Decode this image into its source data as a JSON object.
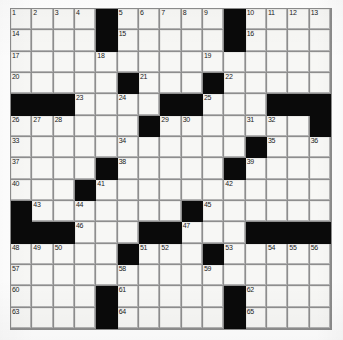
{
  "puzzle": {
    "type": "crossword-grid",
    "rows": 15,
    "columns": 15,
    "block_color": "#0a0a0a",
    "cell_color": "#f7f7f5",
    "grid_line_color": "#8e8e8e",
    "background_color": "#ffffff",
    "cells": [
      [
        {
          "n": "1"
        },
        {
          "n": "2"
        },
        {
          "n": "3"
        },
        {
          "n": "4"
        },
        {
          "b": true
        },
        {
          "n": "5"
        },
        {
          "n": "6"
        },
        {
          "n": "7"
        },
        {
          "n": "8"
        },
        {
          "n": "9"
        },
        {
          "b": true
        },
        {
          "n": "10"
        },
        {
          "n": "11"
        },
        {
          "n": "12"
        },
        {
          "n": "13"
        }
      ],
      [
        {
          "n": "14"
        },
        {},
        {},
        {},
        {
          "b": true
        },
        {
          "n": "15"
        },
        {},
        {},
        {},
        {},
        {
          "b": true
        },
        {
          "n": "16"
        },
        {},
        {},
        {}
      ],
      [
        {
          "n": "17"
        },
        {},
        {},
        {},
        {
          "n": "18"
        },
        {},
        {},
        {},
        {},
        {
          "n": "19"
        },
        {},
        {},
        {},
        {},
        {}
      ],
      [
        {
          "n": "20"
        },
        {},
        {},
        {},
        {},
        {
          "b": true
        },
        {
          "n": "21"
        },
        {},
        {},
        {
          "b": true
        },
        {
          "n": "22"
        },
        {},
        {},
        {},
        {}
      ],
      [
        {
          "b": true
        },
        {
          "b": true
        },
        {
          "b": true
        },
        {
          "n": "23"
        },
        {},
        {
          "n": "24"
        },
        {},
        {
          "b": true
        },
        {
          "b": true
        },
        {
          "n": "25"
        },
        {},
        {},
        {
          "b": true
        },
        {
          "b": true
        },
        {
          "b": true
        }
      ],
      [
        {
          "n": "26"
        },
        {
          "n": "27"
        },
        {
          "n": "28"
        },
        {},
        {},
        {},
        {
          "b": true
        },
        {
          "n": "29"
        },
        {
          "n": "30"
        },
        {},
        {},
        {
          "n": "31"
        },
        {
          "n": "32"
        },
        {},
        {
          "b": true
        }
      ],
      [
        {
          "n": "33"
        },
        {},
        {},
        {},
        {},
        {
          "n": "34"
        },
        {},
        {},
        {},
        {},
        {},
        {
          "b": true
        },
        {
          "n": "35"
        },
        {},
        {
          "n": "36"
        }
      ],
      [
        {
          "n": "37"
        },
        {},
        {},
        {},
        {
          "b": true
        },
        {
          "n": "38"
        },
        {},
        {},
        {},
        {},
        {
          "b": true
        },
        {
          "n": "39"
        },
        {},
        {},
        {}
      ],
      [
        {
          "n": "40"
        },
        {},
        {},
        {
          "b": true
        },
        {
          "n": "41"
        },
        {},
        {},
        {},
        {},
        {},
        {
          "n": "42"
        },
        {},
        {},
        {},
        {}
      ],
      [
        {
          "b": true
        },
        {
          "n": "43"
        },
        {},
        {
          "n": "44"
        },
        {},
        {},
        {},
        {},
        {
          "b": true
        },
        {
          "n": "45"
        },
        {},
        {},
        {},
        {},
        {}
      ],
      [
        {
          "b": true
        },
        {
          "b": true
        },
        {
          "b": true
        },
        {
          "n": "46"
        },
        {},
        {},
        {
          "b": true
        },
        {
          "b": true
        },
        {
          "n": "47"
        },
        {},
        {},
        {
          "b": true
        },
        {
          "b": true
        },
        {
          "b": true
        },
        {
          "b": true
        }
      ],
      [
        {
          "n": "48"
        },
        {
          "n": "49"
        },
        {
          "n": "50"
        },
        {},
        {},
        {
          "b": true
        },
        {
          "n": "51"
        },
        {
          "n": "52"
        },
        {},
        {
          "b": true
        },
        {
          "n": "53"
        },
        {},
        {
          "n": "54"
        },
        {
          "n": "55"
        },
        {
          "n": "56"
        }
      ],
      [
        {
          "n": "57"
        },
        {},
        {},
        {},
        {},
        {
          "n": "58"
        },
        {},
        {},
        {},
        {
          "n": "59"
        },
        {},
        {},
        {},
        {},
        {}
      ],
      [
        {
          "n": "60"
        },
        {},
        {},
        {},
        {
          "b": true
        },
        {
          "n": "61"
        },
        {},
        {},
        {},
        {},
        {
          "b": true
        },
        {
          "n": "62"
        },
        {},
        {},
        {}
      ],
      [
        {
          "n": "63"
        },
        {},
        {},
        {},
        {
          "b": true
        },
        {
          "n": "64"
        },
        {},
        {},
        {},
        {},
        {
          "b": true
        },
        {
          "n": "65"
        },
        {},
        {},
        {}
      ]
    ]
  }
}
